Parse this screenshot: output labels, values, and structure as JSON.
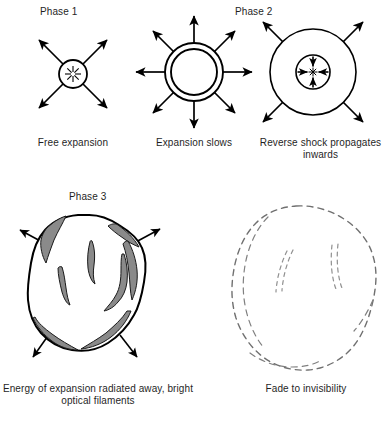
{
  "figure": {
    "background_color": "#ffffff",
    "stroke_color": "#000000",
    "filament_fill_color": "#8a8a8a",
    "fade_stroke_color": "#808080"
  },
  "headings": {
    "phase1": "Phase 1",
    "phase2": "Phase 2",
    "phase3": "Phase 3"
  },
  "captions": {
    "free_expansion": "Free expansion",
    "expansion_slows": "Expansion slows",
    "reverse_shock": "Reverse shock propagates inwards",
    "energy_radiated": "Energy of expansion radiated away, bright optical filaments",
    "fade_to_invisibility": "Fade to invisibility"
  },
  "panels": [
    {
      "id": "free-expansion",
      "heading": "Phase 1",
      "caption": "Free expansion",
      "shape": "small-circle-with-radiating-spokes",
      "center": [
        73,
        74
      ],
      "radius": 14,
      "arrow_count": 4,
      "arrow_direction": "outward",
      "arrow_angles_deg": [
        45,
        135,
        225,
        315
      ]
    },
    {
      "id": "expansion-slows",
      "heading": "",
      "caption": "Expansion slows",
      "shape": "double-concentric-circle",
      "center": [
        194,
        72
      ],
      "outer_radius": 29,
      "inner_radius": 23,
      "arrow_count": 8,
      "arrow_direction": "outward",
      "arrow_angles_deg": [
        0,
        45,
        90,
        135,
        180,
        225,
        270,
        315
      ]
    },
    {
      "id": "reverse-shock",
      "heading": "Phase 2",
      "caption": "Reverse shock propagates inwards",
      "shape": "large-circle-with-inner-circle",
      "center": [
        313,
        72
      ],
      "outer_radius": 43,
      "inner_radius": 17,
      "outward_arrow_count": 4,
      "outward_arrow_angles_deg": [
        45,
        135,
        225,
        315
      ],
      "inward_arrow_count": 4,
      "inward_arrow_angles_deg": [
        0,
        90,
        180,
        270
      ]
    },
    {
      "id": "energy-radiated",
      "heading": "Phase 3",
      "caption": "Energy of expansion radiated away, bright optical filaments",
      "shape": "irregular-blob-with-gray-filaments",
      "bounds": [
        28,
        214,
        146,
        352
      ],
      "filament_count": 6,
      "arrow_count": 4,
      "arrow_direction": "outward"
    },
    {
      "id": "fade-to-invisibility",
      "heading": "",
      "caption": "Fade to invisibility",
      "shape": "dashed-irregular-blob",
      "bounds": [
        232,
        205,
        376,
        371
      ],
      "filament_count": 2,
      "arrow_count": 0,
      "line_style": "dashed"
    }
  ]
}
